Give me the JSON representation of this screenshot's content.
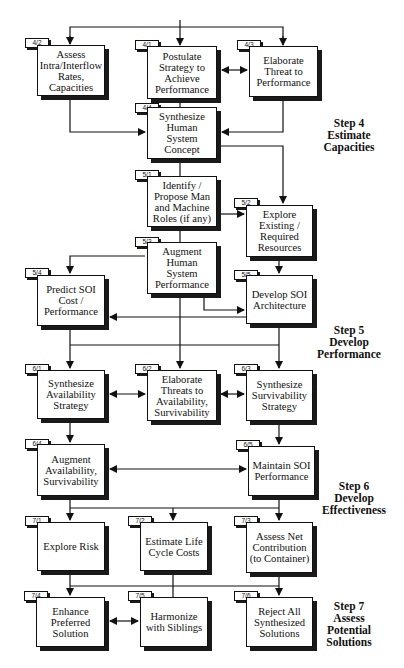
{
  "diagram": {
    "boxes": [
      {
        "id": "4/2",
        "label": "Assess\nIntra/Interflow\nRates,\nCapacities"
      },
      {
        "id": "4/1",
        "label": "Postulate\nStrategy to\nAchieve\nPerformance"
      },
      {
        "id": "4/3",
        "label": "Elaborate\nThreat to\nPerformance"
      },
      {
        "id": "4/4",
        "label": "Synthesize\nHuman\nSystem\nConcept"
      },
      {
        "id": "5/1",
        "label": "Identify /\nPropose Man\nand Machine\nRoles (if any)"
      },
      {
        "id": "5/2",
        "label": "Explore\nExisting /\nRequired\nResources"
      },
      {
        "id": "5/3",
        "label": "Augment\nHuman\nSystem\nPerformance"
      },
      {
        "id": "5/4",
        "label": "Predict SOI\nCost /\nPerformance"
      },
      {
        "id": "5/5",
        "label": "Develop SOI\nArchitecture"
      },
      {
        "id": "6/1",
        "label": "Synthesize\nAvailability\nStrategy"
      },
      {
        "id": "6/2",
        "label": "Elaborate\nThreats to\nAvailability,\nSurvivability"
      },
      {
        "id": "6/3",
        "label": "Synthesize\nSurvivability\nStrategy"
      },
      {
        "id": "6/4",
        "label": "Augment\nAvailability,\nSurvivability"
      },
      {
        "id": "6/5",
        "label": "Maintain SOI\nPerformance"
      },
      {
        "id": "7/1",
        "label": "Explore Risk"
      },
      {
        "id": "7/2",
        "label": "Estimate Life\nCycle Costs"
      },
      {
        "id": "7/3",
        "label": "Assess Net\nContribution\n(to Container)"
      },
      {
        "id": "7/4",
        "label": "Enhance\nPreferred\nSolution"
      },
      {
        "id": "7/5",
        "label": "Harmonize\nwith Siblings"
      },
      {
        "id": "7/6",
        "label": "Reject All\nSynthesized\nSolutions"
      }
    ],
    "steps": [
      {
        "label": "Step 4\nEstimate\nCapacities"
      },
      {
        "label": "Step 5\nDevelop\nPerformance"
      },
      {
        "label": "Step 6\nDevelop\nEffectiveness"
      },
      {
        "label": "Step 7\nAssess\nPotential\nSolutions"
      }
    ]
  }
}
